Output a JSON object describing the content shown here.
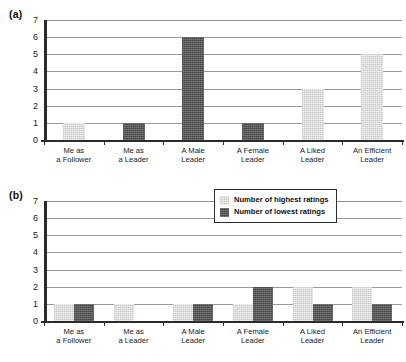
{
  "panels": [
    {
      "label": "(a)"
    },
    {
      "label": "(b)"
    }
  ],
  "legend": {
    "position": "top-right-of-panel-b",
    "entries": [
      {
        "key": "highest",
        "label": "Number of highest ratings",
        "color": "#dcdcdc"
      },
      {
        "key": "lowest",
        "label": "Number of lowest ratings",
        "color": "#595959"
      }
    ]
  },
  "axis": {
    "y_ticks": [
      "0",
      "1",
      "2",
      "3",
      "4",
      "5",
      "6",
      "7"
    ],
    "y_min": 0,
    "y_max": 7
  },
  "categories": [
    {
      "line1": "Me as",
      "line2": "a Follower"
    },
    {
      "line1": "Me as",
      "line2": "a Leader"
    },
    {
      "line1": "A Male",
      "line2": "Leader"
    },
    {
      "line1": "A Female",
      "line2": "Leader"
    },
    {
      "line1": "A Liked",
      "line2": "Leader"
    },
    {
      "line1": "An Efficient",
      "line2": "Leader"
    }
  ],
  "chart_data": [
    {
      "type": "bar",
      "panel": "(a)",
      "title": "",
      "xlabel": "",
      "ylabel": "",
      "ylim": [
        0,
        7
      ],
      "yticks": [
        0,
        1,
        2,
        3,
        4,
        5,
        6,
        7
      ],
      "grid": true,
      "legend": "none",
      "categories": [
        "Me as a Follower",
        "Me as a Leader",
        "A Male Leader",
        "A Female Leader",
        "A Liked Leader",
        "An Efficient Leader"
      ],
      "series": [
        {
          "name": "Number of highest ratings",
          "color": "#dcdcdc",
          "values": [
            1,
            0,
            0,
            0,
            3,
            5
          ]
        },
        {
          "name": "Number of lowest ratings",
          "color": "#595959",
          "values": [
            0,
            1,
            6,
            1,
            0,
            0
          ]
        }
      ]
    },
    {
      "type": "bar",
      "panel": "(b)",
      "title": "",
      "xlabel": "",
      "ylabel": "",
      "ylim": [
        0,
        7
      ],
      "yticks": [
        0,
        1,
        2,
        3,
        4,
        5,
        6,
        7
      ],
      "grid": true,
      "legend": "top-right",
      "categories": [
        "Me as a Follower",
        "Me as a Leader",
        "A Male Leader",
        "A Female Leader",
        "A Liked Leader",
        "An Efficient Leader"
      ],
      "series": [
        {
          "name": "Number of highest ratings",
          "color": "#dcdcdc",
          "values": [
            1,
            1,
            1,
            1,
            2,
            2
          ]
        },
        {
          "name": "Number of lowest ratings",
          "color": "#595959",
          "values": [
            1,
            0,
            1,
            2,
            1,
            1
          ]
        }
      ]
    }
  ]
}
